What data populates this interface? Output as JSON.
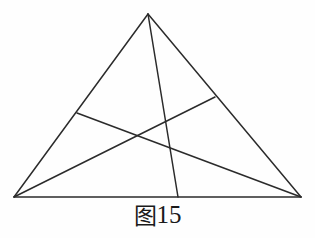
{
  "figure": {
    "caption_cjk": "图",
    "caption_number": "15",
    "caption_full": "图15",
    "background_color": "#fefefe",
    "stroke_color": "#2b2b2b",
    "stroke_width": 1.5
  },
  "chart_data": {
    "type": "diagram",
    "title": "图15",
    "shape": "triangle-with-three-cevians",
    "xlabel": "",
    "ylabel": "",
    "xlim": [
      0,
      315
    ],
    "ylim": [
      0,
      238
    ],
    "grid": false,
    "legend": "none",
    "points": [
      {
        "id": "A",
        "role": "apex-vertex",
        "x": 148,
        "y": 14
      },
      {
        "id": "B",
        "role": "bottom-left-vertex",
        "x": 14,
        "y": 197
      },
      {
        "id": "C",
        "role": "bottom-right-vertex",
        "x": 301,
        "y": 197
      },
      {
        "id": "D",
        "role": "base-cevian-foot",
        "x": 178,
        "y": 197
      },
      {
        "id": "E",
        "role": "left-edge-point",
        "x": 77,
        "y": 113
      },
      {
        "id": "F",
        "role": "right-edge-point",
        "x": 215,
        "y": 97
      }
    ],
    "segments": [
      {
        "id": "side-AB",
        "name": "triangle-left-side",
        "from": "A",
        "to": "B"
      },
      {
        "id": "side-AC",
        "name": "triangle-right-side",
        "from": "A",
        "to": "C"
      },
      {
        "id": "side-BC",
        "name": "triangle-base",
        "from": "B",
        "to": "C"
      },
      {
        "id": "cevian-AD",
        "name": "cevian-apex-to-base",
        "from": "A",
        "to": "D"
      },
      {
        "id": "cevian-EC",
        "name": "cevian-left-edge-to-bottom-right",
        "from": "E",
        "to": "C"
      },
      {
        "id": "cevian-BF",
        "name": "cevian-bottom-left-to-right-edge",
        "from": "B",
        "to": "F"
      }
    ]
  }
}
